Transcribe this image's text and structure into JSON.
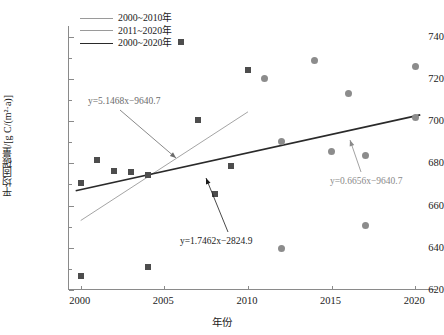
{
  "chart_data": {
    "type": "scatter",
    "title": "",
    "xlabel": "年份",
    "ylabel": "平均固碳量/[g C/(m²·a)]",
    "xlim": [
      1999.3,
      2021.3
    ],
    "ylim": [
      620,
      745
    ],
    "xticks": [
      2000,
      2005,
      2010,
      2015,
      2020
    ],
    "yticks": [
      620,
      640,
      660,
      680,
      700,
      720,
      740
    ],
    "yticks_minor": [
      630,
      650,
      670,
      690,
      710,
      730
    ],
    "grid": false,
    "legend_position": "top-left",
    "series": [
      {
        "name": "2000~2010年",
        "marker": "square",
        "color": "#4d4d4d",
        "points": [
          {
            "x": 2000,
            "y": 626.5
          },
          {
            "x": 2000,
            "y": 670.5
          },
          {
            "x": 2001,
            "y": 681.5
          },
          {
            "x": 2002,
            "y": 676.5
          },
          {
            "x": 2003,
            "y": 676.0
          },
          {
            "x": 2004,
            "y": 631.0
          },
          {
            "x": 2004,
            "y": 674.5
          },
          {
            "x": 2006,
            "y": 737.5
          },
          {
            "x": 2007,
            "y": 700.5
          },
          {
            "x": 2008,
            "y": 665.5
          },
          {
            "x": 2009,
            "y": 678.5
          },
          {
            "x": 2010,
            "y": 724.0
          }
        ]
      },
      {
        "name": "2011~2020年",
        "marker": "circle",
        "color": "#8c8c8c",
        "points": [
          {
            "x": 2011,
            "y": 720.0
          },
          {
            "x": 2012,
            "y": 639.5
          },
          {
            "x": 2012,
            "y": 690.5
          },
          {
            "x": 2014,
            "y": 728.5
          },
          {
            "x": 2015,
            "y": 685.5
          },
          {
            "x": 2016,
            "y": 713.0
          },
          {
            "x": 2017,
            "y": 650.5
          },
          {
            "x": 2017,
            "y": 683.5
          },
          {
            "x": 2020,
            "y": 726.0
          },
          {
            "x": 2020,
            "y": 701.5
          }
        ]
      }
    ],
    "trendlines": [
      {
        "name": "2000~2010年",
        "equation": "y=5.1468x−9640.7",
        "slope": 5.1468,
        "intercept": -9640.7,
        "color": "#9a9a9a",
        "x_start": 2000.0,
        "x_end": 2010.0,
        "label_x": 2001.0,
        "label_y": 706.0
      },
      {
        "name": "2011~2020年",
        "equation": "y=0.6656x−9640.7",
        "slope": 0.6656,
        "intercept": -9640.7,
        "color": "#9a9a9a",
        "x_start": 2011.0,
        "x_end": 2020.0,
        "label_x": 2017.0,
        "label_y": 677.5
      },
      {
        "name": "2000~2020年",
        "equation": "y=1.7462x−2824.9",
        "slope": 1.7462,
        "intercept": -2824.9,
        "color": "#2a2a2a",
        "x_start": 1999.7,
        "x_end": 2020.3,
        "label_x": 2008.4,
        "label_y": 657.5
      }
    ],
    "legend": [
      {
        "label": "2000~2010年",
        "color": "#9a9a9a",
        "width": 0.9
      },
      {
        "label": "2011~2020年",
        "color": "#9a9a9a",
        "width": 0.9
      },
      {
        "label": "2000~2020年",
        "color": "#2a2a2a",
        "width": 1.6
      }
    ],
    "annotations": [
      {
        "text": "y=5.1468x−9640.7",
        "color": "#6b6b6b",
        "text_px": {
          "left": 88,
          "top": 96
        },
        "arrow": {
          "x1": 120,
          "y1": 110,
          "x2": 176,
          "y2": 158
        }
      },
      {
        "text": "y=1.7462x−2824.9",
        "color": "#1a1a1a",
        "text_px": {
          "left": 180,
          "top": 236
        },
        "arrow": {
          "x1": 228,
          "y1": 232,
          "x2": 206,
          "y2": 178
        }
      },
      {
        "text": "y=0.6656x−9640.7",
        "color": "#8a8a8a",
        "text_px": {
          "left": 330,
          "top": 176
        },
        "arrow": {
          "x1": 361,
          "y1": 172,
          "x2": 350,
          "y2": 140
        }
      }
    ]
  }
}
